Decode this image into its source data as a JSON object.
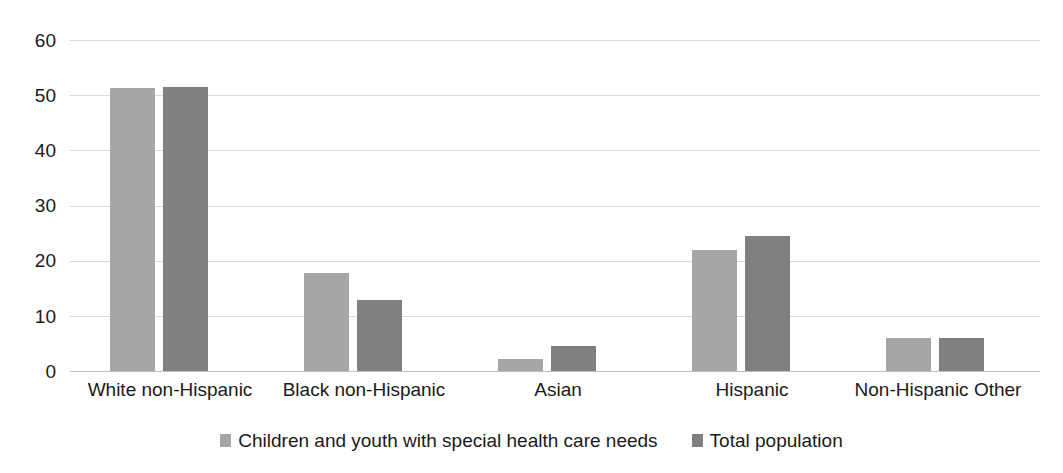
{
  "chart_data": {
    "type": "bar",
    "title": "",
    "subtitle": "",
    "xlabel": "",
    "ylabel": "",
    "categories": [
      "White non-Hispanic",
      "Black non-Hispanic",
      "Asian",
      "Hispanic",
      "Non-Hispanic Other"
    ],
    "series": [
      {
        "name": "Children and youth with special health care needs",
        "color": "#a6a6a6",
        "values": [
          51.3,
          17.7,
          2.2,
          22.0,
          6.0
        ]
      },
      {
        "name": "Total population",
        "color": "#808080",
        "values": [
          51.4,
          12.9,
          4.5,
          24.4,
          5.9
        ]
      }
    ],
    "ylim": [
      0,
      60
    ],
    "ytick_labels": [
      "60",
      "50",
      "40",
      "30",
      "20",
      "10",
      "0"
    ],
    "ytick_values": [
      60,
      50,
      40,
      30,
      20,
      10,
      0
    ],
    "grid": true,
    "grid_axis": "y",
    "legend_position": "bottom"
  },
  "axes": {
    "y_ticks": [
      {
        "label": "60",
        "value": 60
      },
      {
        "label": "50",
        "value": 50
      },
      {
        "label": "40",
        "value": 40
      },
      {
        "label": "30",
        "value": 30
      },
      {
        "label": "20",
        "value": 20
      },
      {
        "label": "10",
        "value": 10
      },
      {
        "label": "0",
        "value": 0
      }
    ],
    "x_ticks": [
      {
        "label": "White non-Hispanic"
      },
      {
        "label": "Black non-Hispanic"
      },
      {
        "label": "Asian"
      },
      {
        "label": "Hispanic"
      },
      {
        "label": "Non-Hispanic Other"
      }
    ]
  },
  "legend": {
    "items": [
      {
        "label": "Children and youth with special health care needs",
        "color": "#a6a6a6"
      },
      {
        "label": "Total population",
        "color": "#808080"
      }
    ]
  },
  "colors": {
    "series_0": "#a6a6a6",
    "series_1": "#808080",
    "gridline": "#d9d9d9",
    "baseline": "#bfbfbf",
    "text": "#1a1a1a",
    "background": "#ffffff"
  }
}
